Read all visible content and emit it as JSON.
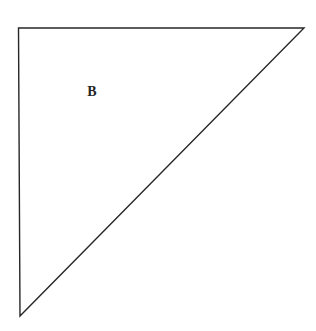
{
  "figure": {
    "kind": "right-triangle-diagram",
    "background_color": "#ffffff",
    "stroke_color": "#272727",
    "stroke_width": 1.4,
    "fill": "none",
    "canvas": {
      "width": 316,
      "height": 331
    },
    "vertices": [
      {
        "name": "top-left-right-angle-vertex",
        "x": 18.5,
        "y": 28
      },
      {
        "name": "top-right-vertex",
        "x": 304,
        "y": 28
      },
      {
        "name": "bottom-left-apex-vertex",
        "x": 20,
        "y": 316
      }
    ],
    "edges": [
      {
        "name": "top-horizontal-edge",
        "from": "top-left-right-angle-vertex",
        "to": "top-right-vertex"
      },
      {
        "name": "hypotenuse-edge",
        "from": "top-right-vertex",
        "to": "bottom-left-apex-vertex"
      },
      {
        "name": "left-vertical-edge",
        "from": "bottom-left-apex-vertex",
        "to": "top-left-right-angle-vertex"
      }
    ],
    "labels": [
      {
        "name": "region-label-b",
        "text": "B",
        "x": 92,
        "y": 92,
        "color": "#252525",
        "font_size_px": 14,
        "bold": true
      }
    ]
  }
}
